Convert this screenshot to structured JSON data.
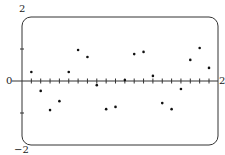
{
  "chart_data": {
    "type": "scatter",
    "title": "",
    "xlabel": "",
    "ylabel": "",
    "xlim": [
      0,
      2
    ],
    "ylim": [
      -2,
      2
    ],
    "grid": false,
    "x_tick_step": 0.1,
    "labels": {
      "y_top": "2",
      "y_zero": "0",
      "y_bottom": "−2",
      "x_right": "2"
    },
    "x": [
      0.1,
      0.2,
      0.3,
      0.4,
      0.5,
      0.6,
      0.7,
      0.8,
      0.9,
      1.0,
      1.1,
      1.2,
      1.3,
      1.4,
      1.5,
      1.6,
      1.7,
      1.8,
      1.9,
      2.0
    ],
    "values": [
      0.28,
      -0.31,
      -0.91,
      -0.63,
      0.28,
      0.97,
      0.75,
      -0.13,
      -0.88,
      -0.81,
      0.03,
      0.84,
      0.91,
      0.16,
      -0.69,
      -0.88,
      -0.25,
      0.66,
      1.03,
      0.41
    ]
  },
  "colors": {
    "frame": "#333333",
    "axis": "#333333",
    "point": "#111111"
  }
}
